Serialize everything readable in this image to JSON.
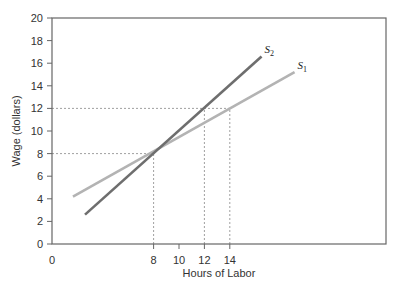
{
  "chart_data": {
    "type": "line",
    "title": "",
    "xlabel": "Hours of Labor",
    "ylabel": "Wage (dollars)",
    "xlim": [
      0,
      26.3
    ],
    "ylim": [
      0,
      20
    ],
    "x_ticks": [
      0,
      8,
      10,
      12,
      14
    ],
    "x_tick_labels": [
      "0",
      "8",
      "10",
      "12",
      "14"
    ],
    "y_ticks": [
      0,
      2,
      4,
      6,
      8,
      10,
      12,
      14,
      16,
      18,
      20
    ],
    "y_tick_labels": [
      "0",
      "2",
      "4",
      "6",
      "8",
      "10",
      "12",
      "14",
      "16",
      "18",
      "20"
    ],
    "grid": false,
    "legend": "inline labels at line ends",
    "series": [
      {
        "name": "S1",
        "label_main": "S",
        "label_sub": "1",
        "color": "#b3b3b3",
        "x": [
          1.65,
          19.1
        ],
        "y": [
          4.2,
          15.2
        ]
      },
      {
        "name": "S2",
        "label_main": "S",
        "label_sub": "2",
        "color": "#6e6e6e",
        "x": [
          2.6,
          16.5
        ],
        "y": [
          2.6,
          16.6
        ]
      }
    ],
    "reference_lines": [
      {
        "type": "horizontal",
        "y": 8,
        "x_to": 8,
        "style": "dotted"
      },
      {
        "type": "vertical",
        "x": 8,
        "y_to": 8,
        "style": "dotted"
      },
      {
        "type": "horizontal",
        "y": 12,
        "x_to": 14,
        "style": "dotted"
      },
      {
        "type": "vertical",
        "x": 12,
        "y_to": 12,
        "style": "dotted"
      },
      {
        "type": "vertical",
        "x": 14,
        "y_to": 12,
        "style": "dotted"
      }
    ],
    "annotations": [
      {
        "text": "Intersection of S1 and S2",
        "x": 8,
        "y": 8
      }
    ]
  }
}
